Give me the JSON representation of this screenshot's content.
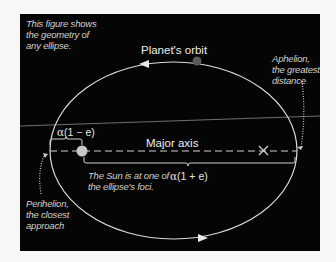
{
  "figure": {
    "background_color": "#050505",
    "page_color": "#f7f7f7",
    "line_color": "#d8d8d8",
    "intro_note": "This figure shows the geometry of any ellipse.",
    "orbit_label": "Planet's orbit",
    "major_axis_label": "Major axis",
    "aphelion_note": "Aphelion, the greatest distance",
    "perihelion_note": "Perihelion, the closest approach",
    "sun_note": "The Sun is at one of the ellipse's foci.",
    "perihelion_distance": {
      "symbol": "α",
      "expression": "(1 − e)"
    },
    "aphelion_distance": {
      "symbol": "α",
      "expression": "(1 + e)"
    },
    "markers": {
      "sun": "sun-focus",
      "empty_focus": "empty-focus-x",
      "planet": "planet"
    },
    "colors": {
      "sun": "#c8c8c8",
      "planet": "#5a5a5a",
      "orbit": "#d9d9d9",
      "horizon_line": "#6e6e6e"
    }
  }
}
